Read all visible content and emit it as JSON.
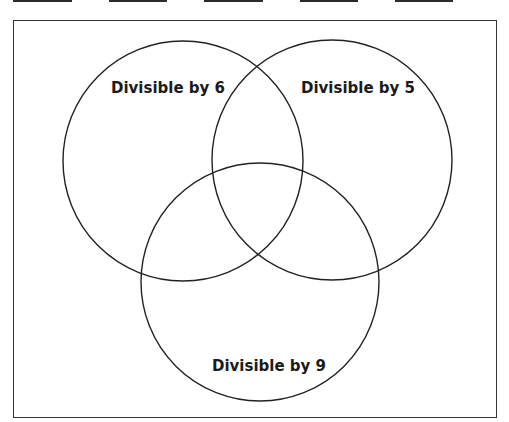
{
  "answer_blanks": [
    {
      "id": "blank-1",
      "value": ""
    },
    {
      "id": "blank-2",
      "value": ""
    },
    {
      "id": "blank-3",
      "value": ""
    },
    {
      "id": "blank-4",
      "value": ""
    },
    {
      "id": "blank-5",
      "value": ""
    }
  ],
  "venn": {
    "sets": [
      {
        "label": "Divisible by 6"
      },
      {
        "label": "Divisible by 5"
      },
      {
        "label": "Divisible by 9"
      }
    ],
    "stroke_color": "#222222",
    "frame_color": "#333333"
  }
}
